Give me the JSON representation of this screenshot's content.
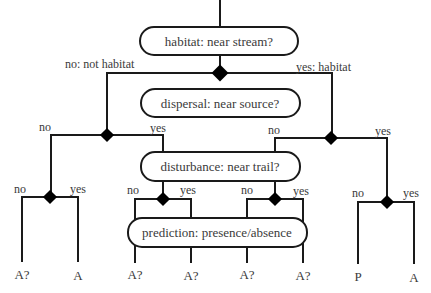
{
  "nodes": {
    "habitat": {
      "label": "habitat: near stream?"
    },
    "dispersal": {
      "label": "dispersal: near source?"
    },
    "disturbance": {
      "label": "disturbance: near trail?"
    },
    "prediction": {
      "label": "prediction: presence/absence"
    }
  },
  "edges": {
    "root_no": "no: not habitat",
    "root_yes": "yes: habitat",
    "left_no": "no",
    "left_yes": "yes",
    "right_no": "no",
    "right_yes": "yes",
    "ll_no": "no",
    "ll_yes": "yes",
    "lr_no": "no",
    "lr_yes": "yes",
    "rl_no": "no",
    "rl_yes": "yes",
    "rr_no": "no",
    "rr_yes": "yes"
  },
  "leaves": [
    "A?",
    "A",
    "A?",
    "A?",
    "A?",
    "A?",
    "P",
    "A"
  ],
  "colors": {
    "line": "#1a1a1a",
    "text": "#3a3a3a",
    "background": "#ffffff"
  }
}
